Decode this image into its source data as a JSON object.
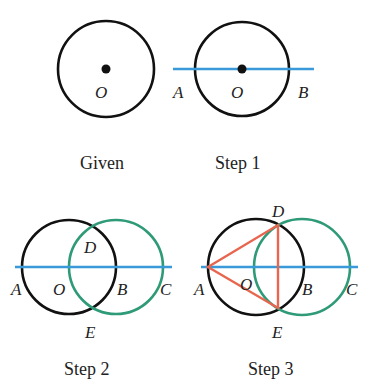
{
  "colors": {
    "circle": "#111111",
    "line": "#3a9ad9",
    "green_circle": "#2e9a78",
    "triangle": "#e8664f"
  },
  "panels": [
    {
      "caption": "Given",
      "labels": {
        "O": "O"
      }
    },
    {
      "caption": "Step 1",
      "labels": {
        "A": "A",
        "O": "O",
        "B": "B"
      }
    },
    {
      "caption": "Step 2",
      "labels": {
        "A": "A",
        "O": "O",
        "B": "B",
        "C": "C",
        "D": "D",
        "E": "E"
      }
    },
    {
      "caption": "Step 3",
      "labels": {
        "A": "A",
        "O": "O",
        "B": "B",
        "C": "C",
        "D": "D",
        "E": "E"
      }
    }
  ]
}
